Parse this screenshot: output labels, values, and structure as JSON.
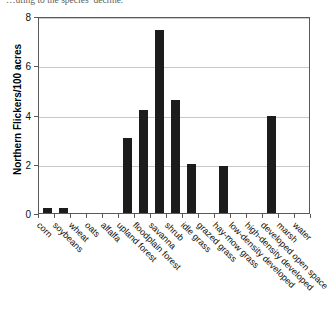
{
  "caption_fragment": "…uting to the species’ decline.",
  "chart_data": {
    "type": "bar",
    "title": "",
    "xlabel": "",
    "ylabel": "Northern Flickers/100 acres",
    "ylim": [
      0,
      8
    ],
    "yticks": [
      0,
      2,
      4,
      6,
      8
    ],
    "grid": true,
    "legend": "none",
    "bar_color": "#1c1c1c",
    "categories": [
      "corn",
      "soybeans",
      "wheat",
      "oats",
      "alfalfa",
      "upland forest",
      "floodplain forest",
      "savanna",
      "shrub",
      "idle grass",
      "grazed grass",
      "hay-mow grass",
      "low-density developed",
      "high-density developed",
      "developed open space",
      "marsh",
      "water"
    ],
    "values": [
      0.2,
      0.2,
      0,
      0,
      0,
      3.05,
      4.2,
      7.45,
      4.6,
      2.0,
      0,
      1.9,
      0,
      0,
      3.95,
      0,
      0
    ]
  }
}
